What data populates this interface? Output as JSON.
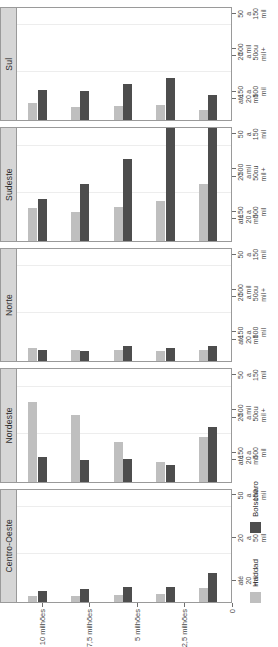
{
  "chart_data": {
    "type": "bar",
    "title": "",
    "subtitle": "",
    "xlabel": "",
    "ylabel": "",
    "orientation": "vertical-bars-in-rotated-figure",
    "grid": true,
    "legend_position": "bottom-left",
    "facet_variable": "Região",
    "facets": [
      "Centro-Oeste",
      "Nordeste",
      "Norte",
      "Sudeste",
      "Sul"
    ],
    "categories": [
      "até\n20\nmil",
      "20\na\n50\nmil",
      "50\na\n150\nmil",
      "150\na\n500\nmil",
      "500\nmil\nou\n+"
    ],
    "category_labels_flat": [
      "até 20 mil",
      "20 a 50 mil",
      "50 a 150 mil",
      "150 a 500 mil",
      "500 mil ou +"
    ],
    "ylim": [
      0,
      11000000
    ],
    "yticks": [
      0,
      2500000,
      5000000,
      7500000,
      10000000
    ],
    "ytick_labels": [
      "0",
      "2,5 milhões",
      "5 milhões",
      "7,5 milhões",
      "10 milhões"
    ],
    "series": [
      {
        "name": "Haddad",
        "color": "#bfbfbf",
        "values_by_facet": {
          "Centro-Oeste": [
            300000,
            300000,
            350000,
            400000,
            750000
          ],
          "Nordeste": [
            4200000,
            3500000,
            2100000,
            1050000,
            2350000
          ],
          "Norte": [
            700000,
            600000,
            600000,
            500000,
            600000
          ],
          "Sudeste": [
            1750000,
            1500000,
            1800000,
            2100000,
            3000000
          ],
          "Sul": [
            900000,
            700000,
            750000,
            800000,
            550000
          ]
        }
      },
      {
        "name": "Bolsonaro",
        "color": "#4d4d4d",
        "values_by_facet": {
          "Centro-Oeste": [
            600000,
            700000,
            800000,
            800000,
            1500000
          ],
          "Nordeste": [
            1300000,
            1150000,
            1200000,
            900000,
            2900000
          ],
          "Norte": [
            600000,
            550000,
            800000,
            700000,
            800000
          ],
          "Sudeste": [
            2200000,
            3000000,
            4300000,
            6300000,
            8800000
          ],
          "Sul": [
            1600000,
            1500000,
            1900000,
            2200000,
            1300000
          ]
        }
      }
    ]
  },
  "legend": {
    "items": [
      {
        "label": "Haddad",
        "color": "#bfbfbf"
      },
      {
        "label": "Bolsonaro",
        "color": "#4d4d4d"
      }
    ]
  },
  "axis": {
    "y_tick_labels": [
      "10 milhões",
      "7,5 milhões",
      "5 milhões",
      "2,5 milhões",
      "0"
    ]
  }
}
